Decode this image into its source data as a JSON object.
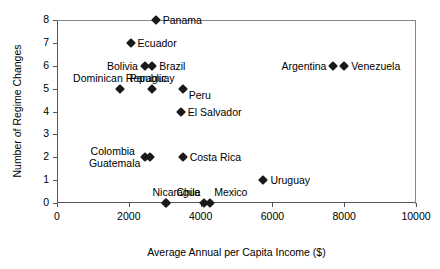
{
  "chart_data": {
    "type": "scatter",
    "title": "",
    "xlabel": "Average Annual per Capita Income ($)",
    "ylabel": "Number of Regime Changes",
    "xlim": [
      0,
      10000
    ],
    "ylim": [
      0,
      8
    ],
    "xticks": [
      0,
      2000,
      4000,
      6000,
      8000,
      10000
    ],
    "yticks": [
      0,
      1,
      2,
      3,
      4,
      5,
      6,
      7,
      8
    ],
    "xtick_labels": [
      "0",
      "2000",
      "4000",
      "6000",
      "8000",
      "10000"
    ],
    "ytick_labels": [
      "0",
      "1",
      "2",
      "3",
      "4",
      "5",
      "6",
      "7",
      "8"
    ],
    "grid": false,
    "legend": false,
    "marker_color": "#1a1a1a",
    "marker_shape": "diamond",
    "points": [
      {
        "name": "Panama",
        "x": 2750,
        "y": 8,
        "label": "Panama",
        "label_pos": "right"
      },
      {
        "name": "Ecuador",
        "x": 2050,
        "y": 7,
        "label": "Ecuador",
        "label_pos": "right"
      },
      {
        "name": "Bolivia",
        "x": 2450,
        "y": 6,
        "label": "Bolivia",
        "label_pos": "left"
      },
      {
        "name": "Brazil",
        "x": 2650,
        "y": 6,
        "label": "Brazil",
        "label_pos": "right"
      },
      {
        "name": "Argentina",
        "x": 7700,
        "y": 6,
        "label": "Argentina",
        "label_pos": "left"
      },
      {
        "name": "Venezuela",
        "x": 8000,
        "y": 6,
        "label": "Venezuela",
        "label_pos": "right"
      },
      {
        "name": "Dominican Republic",
        "x": 1750,
        "y": 5,
        "label": "Dominican Republic",
        "label_pos": "above-center"
      },
      {
        "name": "Paraguay",
        "x": 2650,
        "y": 5,
        "label": "Paraguay",
        "label_pos": "above-center"
      },
      {
        "name": "Peru",
        "x": 3500,
        "y": 5,
        "label": "Peru",
        "label_pos": "below-right"
      },
      {
        "name": "El Salvador",
        "x": 3450,
        "y": 4,
        "label": "El Salvador",
        "label_pos": "right"
      },
      {
        "name": "Colombia",
        "x": 2450,
        "y": 2,
        "label": "Colombia",
        "label_pos": "left-upper"
      },
      {
        "name": "Guatemala",
        "x": 2600,
        "y": 2,
        "label": "Guatemala",
        "label_pos": "left-lower"
      },
      {
        "name": "Costa Rica",
        "x": 3500,
        "y": 2,
        "label": "Costa Rica",
        "label_pos": "right"
      },
      {
        "name": "Uruguay",
        "x": 5750,
        "y": 1,
        "label": "Uruguay",
        "label_pos": "right"
      },
      {
        "name": "Nicaragua",
        "x": 3050,
        "y": 0,
        "label": "Nicaragua",
        "label_pos": "above-left"
      },
      {
        "name": "Chile",
        "x": 3050,
        "y": 0,
        "label": "Chile",
        "label_pos": "above-right"
      },
      {
        "name": "Mexico",
        "x": 4100,
        "y": 0,
        "label": "Mexico",
        "label_pos": "above-far-right"
      },
      {
        "name": "Mexico-pair",
        "x": 4250,
        "y": 0,
        "label": "",
        "label_pos": "none"
      }
    ]
  },
  "axis": {
    "y_title": "Number of Regime Changes",
    "x_title": "Average Annual per Capita Income ($)"
  }
}
